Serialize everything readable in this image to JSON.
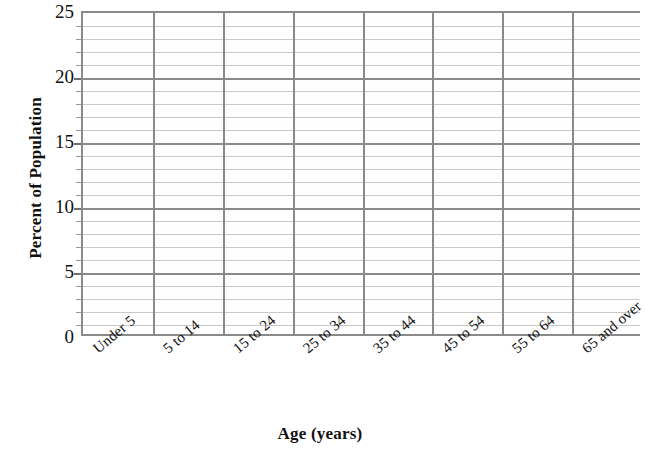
{
  "chart_data": {
    "type": "bar",
    "title": "",
    "xlabel": "Age (years)",
    "ylabel": "Percent of Population",
    "categories": [
      "Under 5",
      "5 to 14",
      "15 to 24",
      "25 to 34",
      "35 to 44",
      "45 to 54",
      "55 to 64",
      "65 and over"
    ],
    "values": [
      null,
      null,
      null,
      null,
      null,
      null,
      null,
      null
    ],
    "series": [],
    "ylim": [
      0,
      25
    ],
    "ytick_labels": [
      "0",
      "5",
      "10",
      "15",
      "20",
      "25"
    ],
    "ytick_values": [
      0,
      5,
      10,
      15,
      20,
      25
    ],
    "y_major_step": 5,
    "y_minor_step": 1,
    "grid": "horizontal-major-and-minor, vertical-category-separators",
    "legend": "none",
    "note": "Empty grid template — no data series plotted",
    "colors": {
      "background": "#ffffff",
      "plot_background": "#fefefe",
      "axis": "#8a8a8a",
      "major_gridline": "#8a8a8a",
      "minor_gridline": "#c9c9c9",
      "text": "#111111"
    }
  }
}
